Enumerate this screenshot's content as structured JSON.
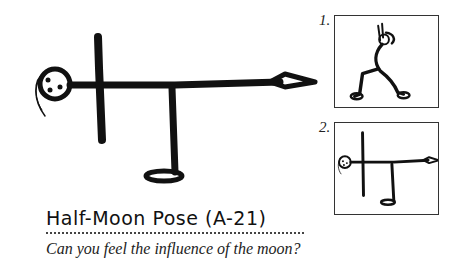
{
  "pose": {
    "title": "Half-Moon Pose (A-21)",
    "subtitle": "Can you feel the influence of the moon?"
  },
  "steps": [
    {
      "label": "1.",
      "description": "lunge-with-arms-up-figure"
    },
    {
      "label": "2.",
      "description": "half-moon-pose-figure"
    }
  ],
  "colors": {
    "ink": "#111111",
    "background": "#ffffff",
    "frame": "#333333"
  }
}
